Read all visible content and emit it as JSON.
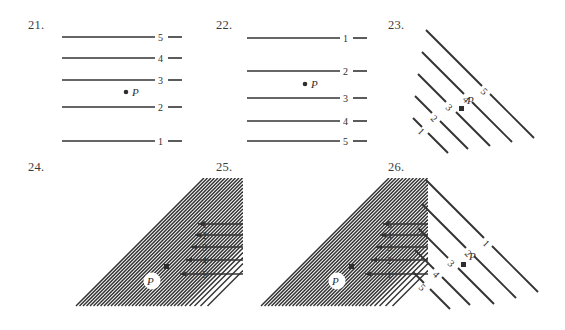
{
  "page": {
    "kind": "geometry-exercise-figures",
    "background_color": "#ffffff",
    "ink_color": "#333333"
  },
  "problems": [
    {
      "id": "21",
      "number_label": "21.",
      "figure_type": "horizontal-parallel-lines",
      "point_label": "P",
      "line_labels": [
        "5",
        "4",
        "3",
        "2",
        "1"
      ],
      "label_order": "top-to-bottom",
      "spacing": "increasing-downward",
      "point_between": [
        "3",
        "2"
      ]
    },
    {
      "id": "22",
      "number_label": "22.",
      "figure_type": "horizontal-parallel-lines",
      "point_label": "P",
      "line_labels": [
        "1",
        "2",
        "3",
        "4",
        "5"
      ],
      "label_order": "top-to-bottom",
      "spacing": "decreasing-downward",
      "point_between": [
        "2",
        "3"
      ]
    },
    {
      "id": "23",
      "number_label": "23.",
      "figure_type": "diagonal-parallel-lines",
      "point_label": "P",
      "line_labels": [
        "5",
        "4",
        "3",
        "2",
        "1"
      ],
      "label_order": "upper-right-to-lower-left",
      "spacing": "increasing-outward",
      "point_on": "3"
    },
    {
      "id": "24",
      "number_label": "24.",
      "figure_type": "dense-diagonal-fan-with-arrows",
      "point_label": "P",
      "line_labels": [
        "1",
        "2",
        "3",
        "4",
        "5"
      ],
      "label_order": "top-to-bottom",
      "spacing": "increasing-downward",
      "arrow_direction": "left"
    },
    {
      "id": "25",
      "number_label": "25.",
      "figure_type": "dense-diagonal-fan-with-arrows",
      "point_label": "P",
      "line_labels": [
        "5",
        "4",
        "3",
        "2",
        "1"
      ],
      "label_order": "top-to-bottom",
      "spacing": "increasing-downward",
      "arrow_direction": "left"
    },
    {
      "id": "26",
      "number_label": "26.",
      "figure_type": "diagonal-parallel-lines",
      "point_label": "P",
      "line_labels": [
        "1",
        "2",
        "3",
        "4",
        "5"
      ],
      "label_order": "upper-right-to-lower-left",
      "spacing": "increasing-outward",
      "point_on": "3"
    }
  ]
}
